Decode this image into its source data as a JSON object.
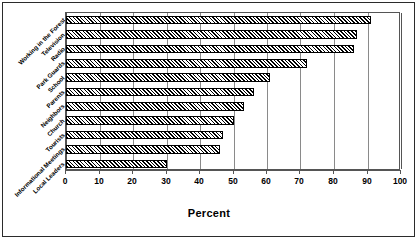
{
  "chart_data": {
    "type": "bar",
    "orientation": "horizontal",
    "title": "",
    "xlabel": "Percent",
    "ylabel": "",
    "xlim": [
      0,
      100
    ],
    "xticks": [
      0,
      10,
      20,
      30,
      40,
      50,
      60,
      70,
      80,
      90,
      100
    ],
    "grid": true,
    "legend": false,
    "bar_style": "diagonal-hatch",
    "categories": [
      "Working in the Forest",
      "Television",
      "Radio",
      "Park Guards",
      "School",
      "Parents",
      "Neighbors",
      "Church",
      "Tourists",
      "Informational Meetings",
      "Local Leaders"
    ],
    "values": [
      91,
      87,
      86,
      72,
      61,
      56,
      53,
      50,
      47,
      46,
      30
    ]
  },
  "axis": {
    "x_title": "Percent",
    "tick_labels": [
      "0",
      "10",
      "20",
      "30",
      "40",
      "50",
      "60",
      "70",
      "80",
      "90",
      "100"
    ]
  },
  "colors": {
    "frame": "#2b2b2b",
    "plot_border": "#555555",
    "gridline": "#8a8a8a",
    "bar_fill": "#000000",
    "background": "#ffffff"
  }
}
